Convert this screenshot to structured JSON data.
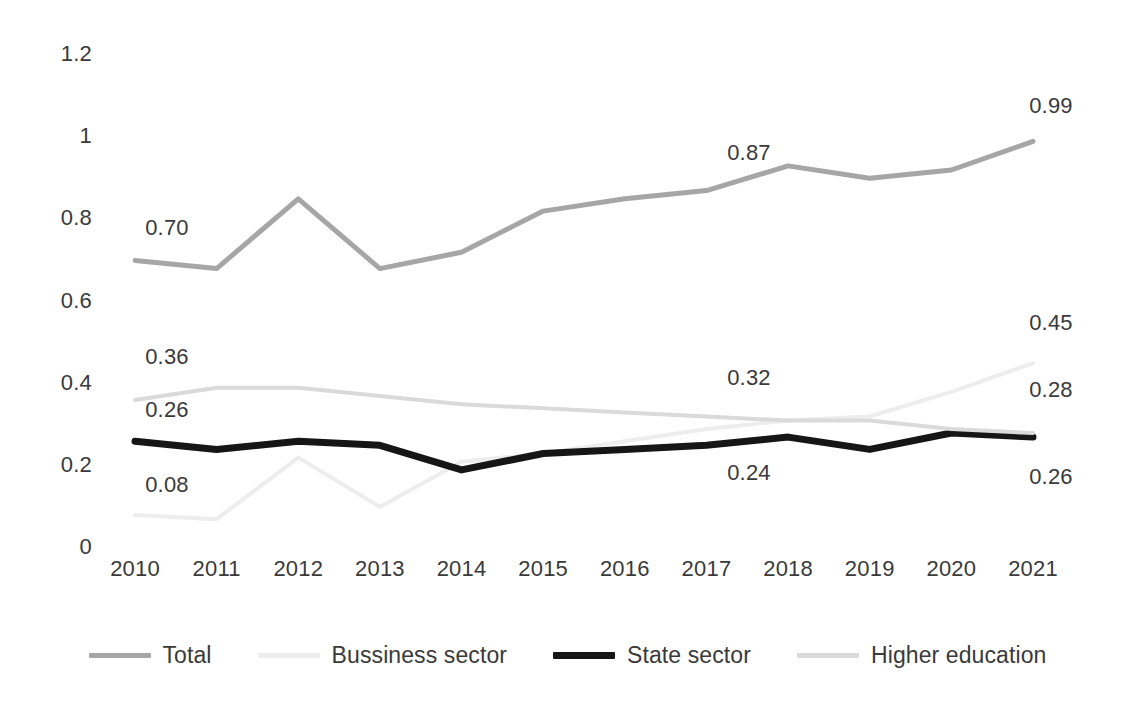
{
  "chart_data": {
    "type": "line",
    "title": "",
    "subtitle": "",
    "xlabel": "",
    "ylabel": "",
    "categories": [
      "2010",
      "2011",
      "2012",
      "2013",
      "2014",
      "2015",
      "2016",
      "2017",
      "2018",
      "2019",
      "2020",
      "2021"
    ],
    "x": [
      2010,
      2011,
      2012,
      2013,
      2014,
      2015,
      2016,
      2017,
      2018,
      2019,
      2020,
      2021
    ],
    "ylim": [
      0,
      1.2
    ],
    "yticks": [
      "1.2",
      "1",
      "0.8",
      "0.6",
      "0.4",
      "0.2",
      "0"
    ],
    "ytick_values": [
      1.2,
      1,
      0.8,
      0.6,
      0.4,
      0.2,
      0
    ],
    "grid": false,
    "legend_position": "bottom",
    "series": [
      {
        "name": "Total",
        "color": "#a6a6a6",
        "width": 5,
        "values": [
          0.7,
          0.68,
          0.85,
          0.68,
          0.72,
          0.82,
          0.85,
          0.87,
          0.93,
          0.9,
          0.92,
          0.99
        ]
      },
      {
        "name": "Bussiness sector",
        "color": "#ededed",
        "width": 4,
        "values": [
          0.08,
          0.07,
          0.22,
          0.1,
          0.21,
          0.23,
          0.26,
          0.29,
          0.31,
          0.32,
          0.38,
          0.45
        ]
      },
      {
        "name": "State sector",
        "color": "#161616",
        "width": 7,
        "values": [
          0.26,
          0.24,
          0.26,
          0.25,
          0.19,
          0.23,
          0.24,
          0.25,
          0.27,
          0.24,
          0.28,
          0.27
        ]
      },
      {
        "name": "Higher education",
        "color": "#dadada",
        "width": 4,
        "values": [
          0.36,
          0.39,
          0.39,
          0.37,
          0.35,
          0.34,
          0.33,
          0.32,
          0.31,
          0.31,
          0.29,
          0.28
        ]
      }
    ],
    "annotations": [
      {
        "text": "0.70",
        "series": "Total",
        "x": 2010,
        "value": 0.7,
        "left": 132,
        "top": 215
      },
      {
        "text": "0.87",
        "series": "Total",
        "x": 2017,
        "value": 0.87,
        "left": 714,
        "top": 140
      },
      {
        "text": "0.99",
        "series": "Total",
        "x": 2021,
        "value": 0.99,
        "left": 1016,
        "top": 93
      },
      {
        "text": "0.36",
        "series": "Higher education",
        "x": 2010,
        "value": 0.36,
        "left": 132,
        "top": 344
      },
      {
        "text": "0.32",
        "series": "Higher education",
        "x": 2017,
        "value": 0.32,
        "left": 714,
        "top": 365
      },
      {
        "text": "0.28",
        "series": "Higher education",
        "x": 2021,
        "value": 0.28,
        "left": 1016,
        "top": 377
      },
      {
        "text": "0.26",
        "series": "State sector",
        "x": 2010,
        "value": 0.26,
        "left": 132,
        "top": 397
      },
      {
        "text": "0.24",
        "series": "State sector",
        "x": 2017,
        "value": 0.24,
        "left": 714,
        "top": 460
      },
      {
        "text": "0.26",
        "series": "State sector",
        "x": 2021,
        "value": 0.26,
        "left": 1016,
        "top": 464
      },
      {
        "text": "0.08",
        "series": "Bussiness sector",
        "x": 2010,
        "value": 0.08,
        "left": 132,
        "top": 472
      },
      {
        "text": "0.45",
        "series": "Bussiness sector",
        "x": 2021,
        "value": 0.45,
        "left": 1016,
        "top": 310
      }
    ]
  },
  "legend": {
    "items": [
      {
        "label": "Total",
        "color": "#a6a6a6",
        "thick": false
      },
      {
        "label": "Bussiness sector",
        "color": "#ededed",
        "thick": false
      },
      {
        "label": "State sector",
        "color": "#161616",
        "thick": true
      },
      {
        "label": "Higher education",
        "color": "#dadada",
        "thick": false
      }
    ]
  }
}
